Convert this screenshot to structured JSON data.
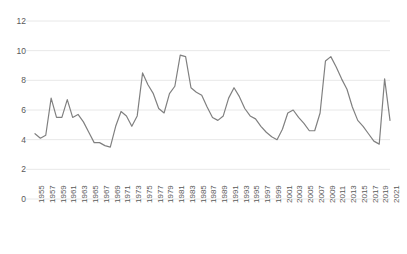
{
  "chart_data": {
    "type": "line",
    "title": "",
    "subtitle": "",
    "xlabel": "",
    "ylabel": "",
    "ylim": [
      0,
      12
    ],
    "yticks": [
      0,
      2,
      4,
      6,
      8,
      10,
      12
    ],
    "grid": true,
    "legend": false,
    "legend_position": "none",
    "line_color": "#808080",
    "grid_color": "#e8e8e8",
    "tick_label_color": "#595959",
    "xtick_step_years": 2,
    "xtick_labels": [
      "1955",
      "1957",
      "1959",
      "1961",
      "1963",
      "1965",
      "1967",
      "1969",
      "1971",
      "1973",
      "1975",
      "1977",
      "1979",
      "1981",
      "1983",
      "1985",
      "1987",
      "1989",
      "1991",
      "1993",
      "1995",
      "1997",
      "1999",
      "2001",
      "2003",
      "2005",
      "2007",
      "2009",
      "2011",
      "2013",
      "2015",
      "2017",
      "2019",
      "2021"
    ],
    "x": [
      1955,
      1956,
      1957,
      1958,
      1959,
      1960,
      1961,
      1962,
      1963,
      1964,
      1965,
      1966,
      1967,
      1968,
      1969,
      1970,
      1971,
      1972,
      1973,
      1974,
      1975,
      1976,
      1977,
      1978,
      1979,
      1980,
      1981,
      1982,
      1983,
      1984,
      1985,
      1986,
      1987,
      1988,
      1989,
      1990,
      1991,
      1992,
      1993,
      1994,
      1995,
      1996,
      1997,
      1998,
      1999,
      2000,
      2001,
      2002,
      2003,
      2004,
      2005,
      2006,
      2007,
      2008,
      2009,
      2010,
      2011,
      2012,
      2013,
      2014,
      2015,
      2016,
      2017,
      2018,
      2019,
      2020,
      2021
    ],
    "series": [
      {
        "name": "Unemployment rate",
        "values": [
          4.4,
          4.1,
          4.3,
          6.8,
          5.5,
          5.5,
          6.7,
          5.5,
          5.7,
          5.2,
          4.5,
          3.8,
          3.8,
          3.6,
          3.5,
          4.9,
          5.9,
          5.6,
          4.9,
          5.6,
          8.5,
          7.7,
          7.1,
          6.1,
          5.8,
          7.1,
          7.6,
          9.7,
          9.6,
          7.5,
          7.2,
          7.0,
          6.2,
          5.5,
          5.3,
          5.6,
          6.8,
          7.5,
          6.9,
          6.1,
          5.6,
          5.4,
          4.9,
          4.5,
          4.2,
          4.0,
          4.7,
          5.8,
          6.0,
          5.5,
          5.1,
          4.6,
          4.6,
          5.8,
          9.3,
          9.6,
          8.9,
          8.1,
          7.4,
          6.2,
          5.3,
          4.9,
          4.4,
          3.9,
          3.7,
          8.1,
          5.3
        ]
      }
    ]
  }
}
